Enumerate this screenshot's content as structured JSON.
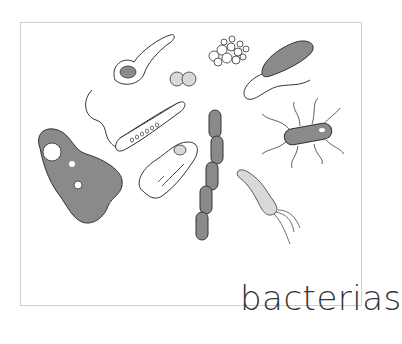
{
  "illustration": {
    "caption": "bacterias",
    "colors": {
      "outline": "#333333",
      "dark_fill": "#8a8a8a",
      "light_fill": "#d9d9d9",
      "background": "#ffffff",
      "border": "#cfcfcf"
    },
    "organisms": [
      {
        "name": "amoeba-like-cell",
        "fill": "dark"
      },
      {
        "name": "spoon-shaped-cell",
        "fill": "outline"
      },
      {
        "name": "diplococcus",
        "fill": "light"
      },
      {
        "name": "staphylococcus-cluster",
        "fill": "outline"
      },
      {
        "name": "flagellated-rod",
        "fill": "dark"
      },
      {
        "name": "spirillum-with-tail",
        "fill": "outline"
      },
      {
        "name": "ciliated-cell",
        "fill": "outline"
      },
      {
        "name": "streptobacillus-chain",
        "fill": "dark"
      },
      {
        "name": "peritrichous-rod",
        "fill": "dark"
      },
      {
        "name": "vibrio-with-flagella",
        "fill": "light"
      }
    ]
  }
}
